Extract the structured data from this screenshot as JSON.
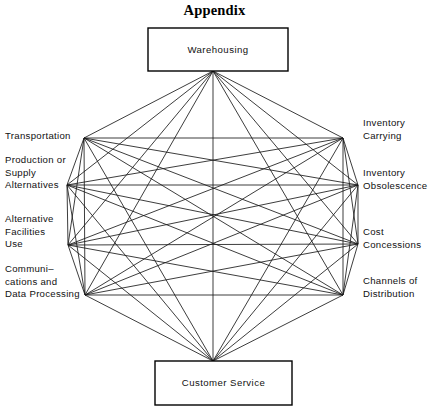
{
  "figure": {
    "title": "Appendix",
    "type": "network-diagram",
    "width": 429,
    "height": 414,
    "background_color": "#ffffff",
    "line_color": "#1a1a1a",
    "box_stroke_color": "#000000"
  },
  "boxes": [
    {
      "id": "warehousing",
      "label": "Warehousing",
      "x": 148,
      "y": 28,
      "width": 140,
      "height": 43,
      "anchor_x": 213,
      "anchor_y": 71
    },
    {
      "id": "customer-service",
      "label": "Customer Service",
      "x": 155,
      "y": 361,
      "width": 137,
      "height": 44,
      "anchor_x": 213,
      "anchor_y": 361
    }
  ],
  "nodes": [
    {
      "id": "warehousing",
      "label": "Warehousing",
      "x": 213,
      "y": 71,
      "side": "top"
    },
    {
      "id": "inventory-carrying",
      "label": "Inventory\nCarrying",
      "x": 343,
      "y": 138,
      "side": "right",
      "label_x": 363,
      "label_y": 117
    },
    {
      "id": "inventory-obsolescence",
      "label": "Inventory\nObsolescence",
      "x": 358,
      "y": 185,
      "side": "right",
      "label_x": 363,
      "label_y": 167
    },
    {
      "id": "cost-concessions",
      "label": "Cost\nConcessions",
      "x": 358,
      "y": 244,
      "side": "right",
      "label_x": 363,
      "label_y": 226
    },
    {
      "id": "channels-distribution",
      "label": "Channels of\nDistribution",
      "x": 343,
      "y": 295,
      "side": "right",
      "label_x": 363,
      "label_y": 275
    },
    {
      "id": "customer-service",
      "label": "Customer Service",
      "x": 213,
      "y": 361,
      "side": "bottom"
    },
    {
      "id": "communications",
      "label": "Communi–\ncations and\nData Processing",
      "x": 85,
      "y": 295,
      "side": "left",
      "label_x": 5,
      "label_y": 263
    },
    {
      "id": "alternative-facilities",
      "label": "Alternative\nFacilities\nUse",
      "x": 68,
      "y": 245,
      "side": "left",
      "label_x": 5,
      "label_y": 213
    },
    {
      "id": "production-supply",
      "label": "Production or\nSupply\nAlternatives",
      "x": 67,
      "y": 185,
      "side": "left",
      "label_x": 5,
      "label_y": 154
    },
    {
      "id": "transportation",
      "label": "Transportation",
      "x": 84,
      "y": 138,
      "side": "left",
      "label_x": 5,
      "label_y": 130
    }
  ],
  "edges_note": "Complete graph: every node connects to every other node (45 edges)."
}
